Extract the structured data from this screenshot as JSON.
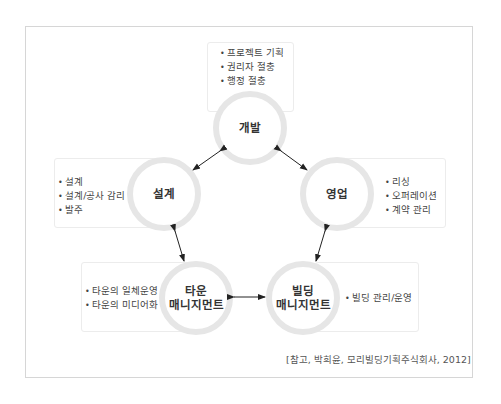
{
  "diagram": {
    "title": "",
    "nodes": [
      {
        "id": "development",
        "label_lines": [
          "개발"
        ],
        "bullets": [
          "프로젝트 기획",
          "권리자 절충",
          "행정 절충"
        ]
      },
      {
        "id": "design",
        "label_lines": [
          "설계"
        ],
        "bullets": [
          "설계",
          "설계/공사 감리",
          "발주"
        ]
      },
      {
        "id": "sales",
        "label_lines": [
          "영업"
        ],
        "bullets": [
          "리싱",
          "오퍼레이션",
          "계약 관리"
        ]
      },
      {
        "id": "town-management",
        "label_lines": [
          "타운",
          "매니지먼트"
        ],
        "bullets": [
          "타운의 일체운영",
          "타운의 미디어화"
        ]
      },
      {
        "id": "building-management",
        "label_lines": [
          "빌딩",
          "매니지먼트"
        ],
        "bullets": [
          "빌딩 관리/운영"
        ]
      }
    ],
    "edges": [
      {
        "from": "development",
        "to": "design",
        "type": "bidirectional"
      },
      {
        "from": "development",
        "to": "sales",
        "type": "bidirectional"
      },
      {
        "from": "design",
        "to": "town-management",
        "type": "bidirectional"
      },
      {
        "from": "sales",
        "to": "building-management",
        "type": "bidirectional"
      },
      {
        "from": "town-management",
        "to": "building-management",
        "type": "bidirectional"
      }
    ],
    "citation": "[참고, 박희윤, 모리빌딩기획주식회사, 2012]",
    "colors": {
      "ring": "#e6e6e6",
      "frame": "#d6d6d6",
      "box_border": "#ececec",
      "arrow": "#222222",
      "text": "#333333"
    }
  }
}
